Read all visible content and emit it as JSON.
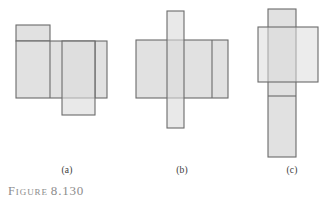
{
  "figure": {
    "caption_word": "Figure",
    "caption_number": "8.130",
    "background": "#ffffff",
    "shape_fill": "#dcdcdc",
    "shape_stroke": "#6b6b6b",
    "label_color": "#3a3a3a",
    "caption_color": "#8c8c8c"
  },
  "panels": [
    {
      "id": "a",
      "label": "(a)",
      "label_x": 67,
      "label_y": 170,
      "shapes": [
        {
          "name": "small-top-rectangle",
          "x": 16,
          "y": 25,
          "w": 34,
          "h": 16
        },
        {
          "name": "large-horizontal-rectangle",
          "x": 16,
          "y": 41,
          "w": 91,
          "h": 57
        },
        {
          "name": "overlapping-vertical-rectangle",
          "x": 62,
          "y": 41,
          "w": 33,
          "h": 74
        }
      ],
      "divider_lines": [
        {
          "name": "vertical-divider-left",
          "x1": 50,
          "y1": 41,
          "x2": 50,
          "y2": 98
        },
        {
          "name": "vertical-divider-right",
          "x1": 95,
          "y1": 41,
          "x2": 95,
          "y2": 98
        }
      ]
    },
    {
      "id": "b",
      "label": "(b)",
      "label_x": 182,
      "label_y": 170,
      "shapes": [
        {
          "name": "tall-vertical-strip",
          "x": 167,
          "y": 11,
          "w": 17,
          "h": 117
        },
        {
          "name": "wide-horizontal-rectangle",
          "x": 136,
          "y": 40,
          "w": 92,
          "h": 58
        }
      ],
      "divider_lines": [
        {
          "name": "vertical-divider-right",
          "x1": 212,
          "y1": 40,
          "x2": 212,
          "y2": 98
        }
      ]
    },
    {
      "id": "c",
      "label": "(c)",
      "label_x": 292,
      "label_y": 170,
      "shapes": [
        {
          "name": "tall-vertical-rectangle",
          "x": 268,
          "y": 9,
          "w": 28,
          "h": 148
        },
        {
          "name": "wide-horizontal-rectangle",
          "x": 258,
          "y": 27,
          "w": 60,
          "h": 55
        }
      ],
      "divider_lines": [
        {
          "name": "horizontal-divider",
          "x1": 268,
          "y1": 96,
          "x2": 296,
          "y2": 96
        }
      ]
    }
  ]
}
